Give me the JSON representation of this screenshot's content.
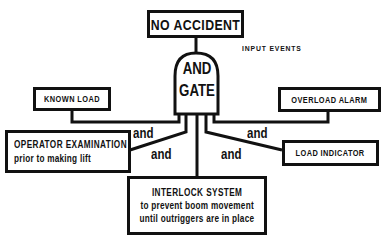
{
  "diagram": {
    "output": {
      "label": "NO ACCIDENT"
    },
    "gate": {
      "line1": "AND",
      "line2": "GATE"
    },
    "input_events_label": "INPUT EVENTS",
    "inputs": [
      {
        "title": "KNOWN LOAD",
        "subtitle": ""
      },
      {
        "title": "OPERATOR EXAMINATION",
        "subtitle": "prior to making lift"
      },
      {
        "title": "INTERLOCK SYSTEM",
        "subtitle": "to prevent boom movement",
        "subtitle2": "until outriggers are in place"
      },
      {
        "title": "LOAD INDICATOR",
        "subtitle": ""
      },
      {
        "title": "OVERLOAD ALARM",
        "subtitle": ""
      }
    ],
    "connectors": [
      "and",
      "and",
      "and",
      "and"
    ],
    "colors": {
      "line": "#111111",
      "background": "#ffffff"
    }
  }
}
